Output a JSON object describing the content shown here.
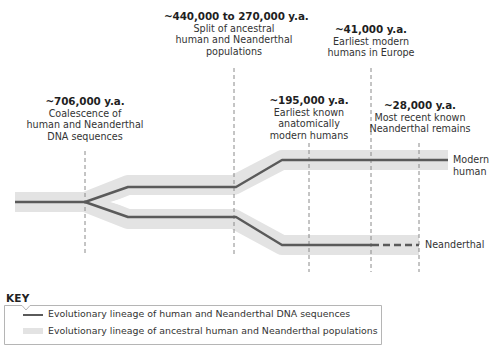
{
  "diagram": {
    "type": "evolutionary-timeline",
    "colors": {
      "dna_lineage": "#5a5a5a",
      "population_band": "#e3e3e3",
      "dashed_guide": "#8a8a8a",
      "key_border": "#b5b5b5"
    },
    "events": [
      {
        "date": "~706,000 y.a.",
        "description_lines": [
          "Coalescence of",
          "human and Neanderthal",
          "DNA sequences"
        ]
      },
      {
        "date": "~440,000 to 270,000 y.a.",
        "description_lines": [
          "Split of ancestral",
          "human and Neanderthal",
          "populations"
        ]
      },
      {
        "date": "~195,000 y.a.",
        "description_lines": [
          "Earliest known",
          "anatomically",
          "modern humans"
        ]
      },
      {
        "date": "~41,000 y.a.",
        "description_lines": [
          "Earliest modern",
          "humans in Europe"
        ]
      },
      {
        "date": "~28,000 y.a.",
        "description_lines": [
          "Most recent known",
          "Neanderthal remains"
        ]
      }
    ],
    "lineages": [
      {
        "name_lines": [
          "Modern",
          "human"
        ]
      },
      {
        "name_lines": [
          "Neanderthal"
        ]
      }
    ],
    "key": {
      "title": "KEY",
      "items": [
        {
          "label": "Evolutionary lineage of human and Neanderthal DNA sequences"
        },
        {
          "label": "Evolutionary lineage of ancestral human and Neanderthal populations"
        }
      ]
    }
  }
}
